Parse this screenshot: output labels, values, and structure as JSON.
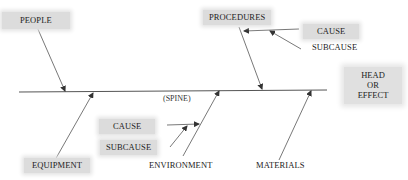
{
  "diagram": {
    "type": "fishbone",
    "head": {
      "lines": [
        "HEAD",
        "OR",
        "EFFECT"
      ]
    },
    "spine_label": "(SPINE)",
    "categories": {
      "people": "PEOPLE",
      "procedures": "PROCEDURES",
      "equipment": "EQUIPMENT",
      "environment": "ENVIRONMENT",
      "materials": "MATERIALS"
    },
    "top_cause": {
      "cause": "CAUSE",
      "subcause": "SUBCAUSE"
    },
    "bottom_cause": {
      "cause": "CAUSE",
      "subcause": "SUBCAUSE"
    },
    "colors": {
      "line": "#444444",
      "label_bg": "#dcdcdc",
      "text": "#222222"
    }
  }
}
